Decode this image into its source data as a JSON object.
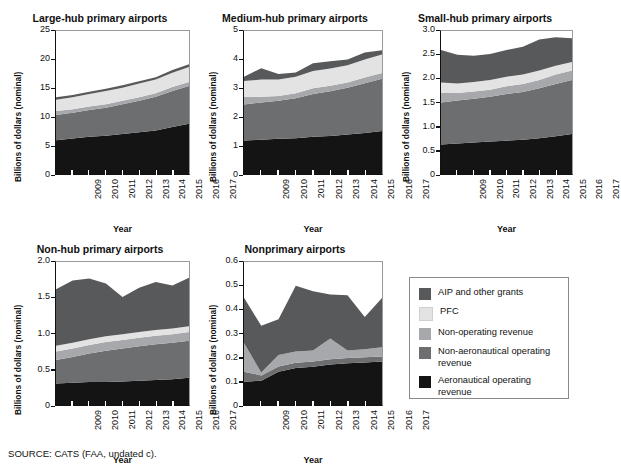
{
  "figure": {
    "source_note": "SOURCE: CATS (FAA, undated c)."
  },
  "legend": {
    "title": "",
    "items": [
      {
        "label": "AIP and other grants",
        "color": "#58595b",
        "key": "aip"
      },
      {
        "label": "PFC",
        "color": "#e3e3e3",
        "key": "pfc"
      },
      {
        "label": "Non-operating revenue",
        "color": "#a6a8ab",
        "key": "nonoperating"
      },
      {
        "label": "Non-aeronautical operating revenue",
        "color": "#6d6e70",
        "key": "nonaero"
      },
      {
        "label": "Aeronautical operating revenue",
        "color": "#141414",
        "key": "aero"
      }
    ]
  },
  "chart_data": [
    {
      "type": "area",
      "stacked": true,
      "title": "Large-hub primary airports",
      "xlabel": "Year",
      "ylabel": "Billions of dollars (nominal)",
      "x": [
        2009,
        2010,
        2011,
        2012,
        2013,
        2014,
        2015,
        2016,
        2017
      ],
      "xticks": [
        "2009",
        "2010",
        "2011",
        "2012",
        "2013",
        "2014",
        "2015",
        "2016",
        "2017"
      ],
      "yticks": [
        0,
        5,
        10,
        15,
        20,
        25
      ],
      "ytick_labels": [
        "0",
        "5",
        "10",
        "15",
        "20",
        "25"
      ],
      "ylim": [
        0,
        25
      ],
      "grid": false,
      "series": [
        {
          "name": "Aeronautical operating revenue",
          "color": "#141414",
          "values": [
            5.9,
            6.2,
            6.5,
            6.7,
            7.0,
            7.3,
            7.6,
            8.2,
            8.8
          ]
        },
        {
          "name": "Non-aeronautical operating revenue",
          "color": "#6d6e70",
          "values": [
            4.4,
            4.5,
            4.7,
            4.9,
            5.2,
            5.5,
            5.9,
            6.3,
            6.6
          ]
        },
        {
          "name": "Non-operating revenue",
          "color": "#a6a8ab",
          "values": [
            0.7,
            0.6,
            0.6,
            0.6,
            0.6,
            0.6,
            0.6,
            0.7,
            0.7
          ]
        },
        {
          "name": "PFC",
          "color": "#e3e3e3",
          "values": [
            2.0,
            2.1,
            2.2,
            2.3,
            2.3,
            2.4,
            2.4,
            2.5,
            2.6
          ]
        },
        {
          "name": "AIP and other grants",
          "color": "#58595b",
          "values": [
            0.4,
            0.4,
            0.4,
            0.4,
            0.4,
            0.4,
            0.4,
            0.5,
            0.5
          ]
        }
      ]
    },
    {
      "type": "area",
      "stacked": true,
      "title": "Medium-hub primary airports",
      "xlabel": "Year",
      "ylabel": "Billions of dollars (nominal)",
      "x": [
        2009,
        2010,
        2011,
        2012,
        2013,
        2014,
        2015,
        2016,
        2017
      ],
      "xticks": [
        "2009",
        "2010",
        "2011",
        "2012",
        "2013",
        "2014",
        "2015",
        "2016",
        "2017"
      ],
      "yticks": [
        0,
        1,
        2,
        3,
        4,
        5
      ],
      "ytick_labels": [
        "0",
        "1",
        "2",
        "3",
        "4",
        "5"
      ],
      "ylim": [
        0,
        5
      ],
      "grid": false,
      "series": [
        {
          "name": "Aeronautical operating revenue",
          "color": "#141414",
          "values": [
            1.17,
            1.2,
            1.23,
            1.25,
            1.3,
            1.33,
            1.38,
            1.43,
            1.5
          ]
        },
        {
          "name": "Non-aeronautical operating revenue",
          "color": "#6d6e70",
          "values": [
            1.26,
            1.3,
            1.33,
            1.4,
            1.5,
            1.56,
            1.64,
            1.74,
            1.83
          ]
        },
        {
          "name": "Non-operating revenue",
          "color": "#a6a8ab",
          "values": [
            0.27,
            0.2,
            0.17,
            0.17,
            0.2,
            0.2,
            0.18,
            0.2,
            0.2
          ]
        },
        {
          "name": "PFC",
          "color": "#e3e3e3",
          "values": [
            0.55,
            0.6,
            0.57,
            0.58,
            0.6,
            0.6,
            0.6,
            0.63,
            0.65
          ]
        },
        {
          "name": "AIP and other grants",
          "color": "#58595b",
          "values": [
            0.15,
            0.4,
            0.2,
            0.15,
            0.27,
            0.25,
            0.2,
            0.25,
            0.15
          ]
        }
      ]
    },
    {
      "type": "area",
      "stacked": true,
      "title": "Small-hub primary airports",
      "xlabel": "Year",
      "ylabel": "Billions of dollars (nominal)",
      "x": [
        2009,
        2010,
        2011,
        2012,
        2013,
        2014,
        2015,
        2016,
        2017
      ],
      "xticks": [
        "2009",
        "2010",
        "2011",
        "2012",
        "2013",
        "2014",
        "2015",
        "2016",
        "2017"
      ],
      "yticks": [
        0,
        0.5,
        1.0,
        1.5,
        2.0,
        2.5,
        3.0
      ],
      "ytick_labels": [
        "0",
        "0.5",
        "1.0",
        "1.5",
        "2.0",
        "2.5",
        "3.0"
      ],
      "ylim": [
        0,
        3.0
      ],
      "grid": false,
      "series": [
        {
          "name": "Aeronautical operating revenue",
          "color": "#141414",
          "values": [
            0.62,
            0.64,
            0.66,
            0.68,
            0.7,
            0.72,
            0.75,
            0.79,
            0.84
          ]
        },
        {
          "name": "Non-aeronautical operating revenue",
          "color": "#6d6e70",
          "values": [
            0.88,
            0.9,
            0.92,
            0.94,
            0.98,
            1.0,
            1.05,
            1.1,
            1.13
          ]
        },
        {
          "name": "Non-operating revenue",
          "color": "#a6a8ab",
          "values": [
            0.2,
            0.16,
            0.15,
            0.15,
            0.16,
            0.17,
            0.17,
            0.2,
            0.2
          ]
        },
        {
          "name": "PFC",
          "color": "#e3e3e3",
          "values": [
            0.22,
            0.2,
            0.2,
            0.2,
            0.2,
            0.2,
            0.2,
            0.18,
            0.18
          ]
        },
        {
          "name": "AIP and other grants",
          "color": "#58595b",
          "values": [
            0.68,
            0.6,
            0.55,
            0.55,
            0.56,
            0.58,
            0.65,
            0.6,
            0.5
          ]
        }
      ]
    },
    {
      "type": "area",
      "stacked": true,
      "title": "Non-hub primary airports",
      "xlabel": "Year",
      "ylabel": "Billions of dollars (nominal)",
      "x": [
        2009,
        2010,
        2011,
        2012,
        2013,
        2014,
        2015,
        2016,
        2017
      ],
      "xticks": [
        "2009",
        "2010",
        "2011",
        "2012",
        "2013",
        "2014",
        "2015",
        "2016",
        "2017"
      ],
      "yticks": [
        0,
        0.5,
        1.0,
        1.5,
        2.0
      ],
      "ytick_labels": [
        "0",
        "0.5",
        "1.0",
        "1.5",
        "2.0"
      ],
      "ylim": [
        0,
        2.0
      ],
      "grid": false,
      "series": [
        {
          "name": "Aeronautical operating revenue",
          "color": "#141414",
          "values": [
            0.3,
            0.31,
            0.32,
            0.32,
            0.33,
            0.34,
            0.35,
            0.36,
            0.38
          ]
        },
        {
          "name": "Non-aeronautical operating revenue",
          "color": "#6d6e70",
          "values": [
            0.33,
            0.36,
            0.4,
            0.44,
            0.46,
            0.48,
            0.5,
            0.51,
            0.52
          ]
        },
        {
          "name": "Non-operating revenue",
          "color": "#a6a8ab",
          "values": [
            0.12,
            0.12,
            0.12,
            0.12,
            0.12,
            0.12,
            0.12,
            0.12,
            0.12
          ]
        },
        {
          "name": "PFC",
          "color": "#e3e3e3",
          "values": [
            0.08,
            0.08,
            0.08,
            0.08,
            0.08,
            0.08,
            0.08,
            0.08,
            0.08
          ]
        },
        {
          "name": "AIP and other grants",
          "color": "#58595b",
          "values": [
            0.79,
            0.87,
            0.85,
            0.74,
            0.52,
            0.62,
            0.67,
            0.6,
            0.68
          ]
        }
      ]
    },
    {
      "type": "area",
      "stacked": true,
      "title": "Nonprimary airports",
      "xlabel": "Year",
      "ylabel": "Billions of dollars (nominal)",
      "x": [
        2009,
        2010,
        2011,
        2012,
        2013,
        2014,
        2015,
        2016,
        2017
      ],
      "xticks": [
        "2009",
        "2010",
        "2011",
        "2012",
        "2013",
        "2014",
        "2015",
        "2016",
        "2017"
      ],
      "yticks": [
        0,
        0.1,
        0.2,
        0.3,
        0.4,
        0.5,
        0.6
      ],
      "ytick_labels": [
        "0",
        "0.1",
        "0.2",
        "0.3",
        "0.4",
        "0.5",
        "0.6"
      ],
      "ylim": [
        0,
        0.6
      ],
      "grid": false,
      "series": [
        {
          "name": "Aeronautical operating revenue",
          "color": "#141414",
          "values": [
            0.098,
            0.102,
            0.14,
            0.155,
            0.16,
            0.17,
            0.175,
            0.178,
            0.182
          ]
        },
        {
          "name": "Non-aeronautical operating revenue",
          "color": "#6d6e70",
          "values": [
            0.042,
            0.022,
            0.022,
            0.022,
            0.022,
            0.022,
            0.022,
            0.022,
            0.022
          ]
        },
        {
          "name": "Non-operating revenue",
          "color": "#a6a8ab",
          "values": [
            0.12,
            0.012,
            0.048,
            0.047,
            0.047,
            0.087,
            0.032,
            0.034,
            0.038
          ]
        },
        {
          "name": "PFC",
          "color": "#e3e3e3",
          "values": [
            0,
            0,
            0,
            0,
            0,
            0,
            0,
            0,
            0
          ]
        },
        {
          "name": "AIP and other grants",
          "color": "#58595b",
          "values": [
            0.19,
            0.196,
            0.15,
            0.276,
            0.248,
            0.185,
            0.231,
            0.135,
            0.207
          ]
        }
      ]
    }
  ]
}
